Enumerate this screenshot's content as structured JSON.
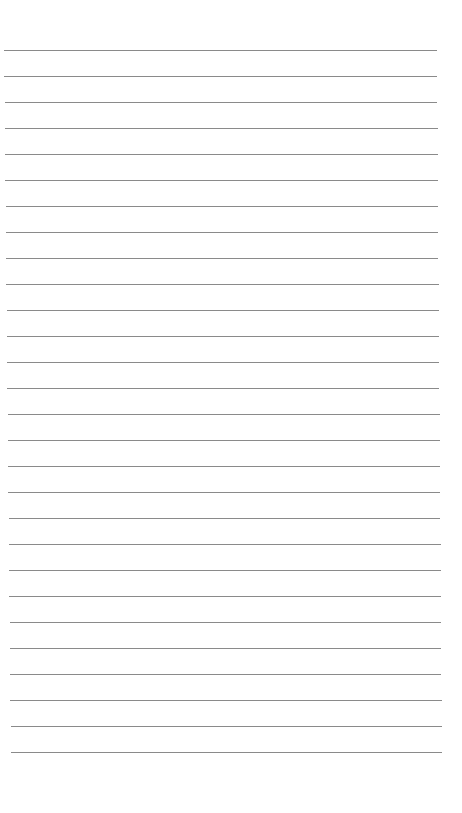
{
  "page": {
    "type": "lined-paper",
    "background": "#ffffff",
    "line_color": "#8a8a8a",
    "line_count": 28,
    "first_line_y": 50,
    "line_spacing": 26,
    "line_left_start": 4,
    "line_left_end": 11,
    "line_right_start": 437,
    "line_right_end": 442
  }
}
